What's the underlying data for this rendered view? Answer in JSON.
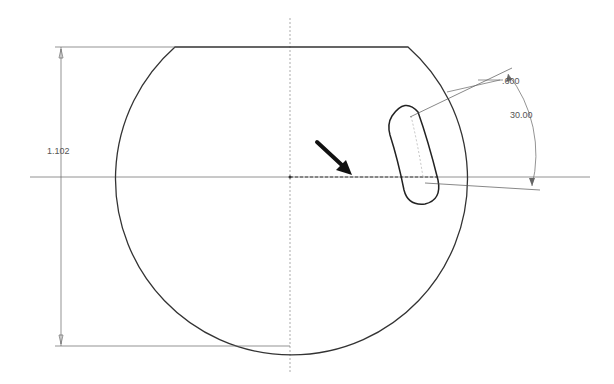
{
  "drawing": {
    "dimensions": {
      "height_label": "1.102",
      "slot_width_label": ".600",
      "angle_label": "30.00"
    },
    "colors": {
      "outline": "#333333",
      "dim_line": "#666666",
      "centerline": "#888888",
      "arrow": "#111111"
    }
  }
}
